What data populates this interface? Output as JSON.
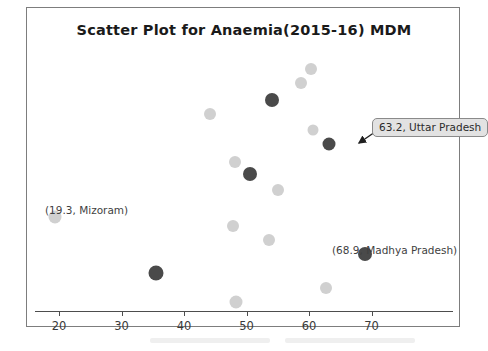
{
  "chart_data": {
    "type": "scatter",
    "title": "Scatter Plot for Anaemia(2015-16) MDM",
    "xlabel": "",
    "ylabel": "",
    "xlim": [
      14,
      77
    ],
    "ylim": [
      0,
      16
    ],
    "grid": false,
    "legend": "none",
    "xticks": [
      20,
      30,
      40,
      50,
      60,
      70
    ],
    "xticklabels": [
      "20",
      "30",
      "40",
      "50",
      "60",
      "70"
    ],
    "point_colors": {
      "light": "#d0d0d0",
      "dark": "#4a4a4a"
    },
    "points": [
      {
        "x": 60.3,
        "y": 15.2,
        "color": "light",
        "r": 6.0
      },
      {
        "x": 58.7,
        "y": 14.3,
        "color": "light",
        "r": 6.0
      },
      {
        "x": 54.0,
        "y": 13.2,
        "color": "dark",
        "r": 7.0
      },
      {
        "x": 44.2,
        "y": 12.3,
        "color": "light",
        "r": 6.0
      },
      {
        "x": 60.6,
        "y": 11.3,
        "color": "light",
        "r": 5.5
      },
      {
        "x": 63.2,
        "y": 10.4,
        "color": "dark",
        "r": 6.5
      },
      {
        "x": 48.2,
        "y": 9.3,
        "color": "light",
        "r": 6.0
      },
      {
        "x": 50.6,
        "y": 8.5,
        "color": "dark",
        "r": 7.0
      },
      {
        "x": 55.0,
        "y": 7.5,
        "color": "light",
        "r": 6.0
      },
      {
        "x": 19.3,
        "y": 5.8,
        "color": "light",
        "r": 6.5
      },
      {
        "x": 47.8,
        "y": 5.2,
        "color": "light",
        "r": 6.0
      },
      {
        "x": 53.6,
        "y": 4.3,
        "color": "light",
        "r": 6.0
      },
      {
        "x": 68.9,
        "y": 3.4,
        "color": "dark",
        "r": 7.0
      },
      {
        "x": 35.5,
        "y": 2.2,
        "color": "dark",
        "r": 7.5
      },
      {
        "x": 62.7,
        "y": 1.3,
        "color": "light",
        "r": 6.0
      },
      {
        "x": 48.3,
        "y": 0.4,
        "color": "light",
        "r": 6.5
      }
    ],
    "annotations": [
      {
        "name": "mizoram-label",
        "text": "(19.3, Mizoram)",
        "style": "plain",
        "x_px": 18,
        "y_px": 196
      },
      {
        "name": "madhya-pradesh-label",
        "text": "(68.9, Madhya Pradesh)",
        "style": "plain",
        "x_px": 305,
        "y_px": 236
      },
      {
        "name": "uttar-pradesh-label",
        "text": "63.2, Uttar Pradesh",
        "style": "callout",
        "x_px": 345,
        "y_px": 110
      }
    ],
    "callout_arrow": {
      "from_px": [
        348,
        124
      ],
      "to_px": [
        332,
        135
      ]
    }
  }
}
